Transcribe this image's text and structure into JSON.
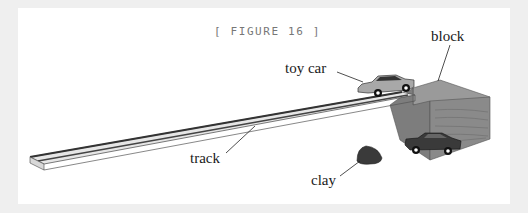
{
  "figure": {
    "caption": "[ FIGURE 16 ]",
    "labels": {
      "toy_car": "toy car",
      "block": "block",
      "track": "track",
      "clay": "clay"
    }
  },
  "colors": {
    "background": "#efefef",
    "panel": "#ffffff",
    "caption": "#777777",
    "block": "#8a8a8a",
    "track_surface": "#e4e4e4",
    "clay": "#3a3a3a",
    "car_top": "#9a9a9a",
    "car_bottom": "#333333"
  }
}
